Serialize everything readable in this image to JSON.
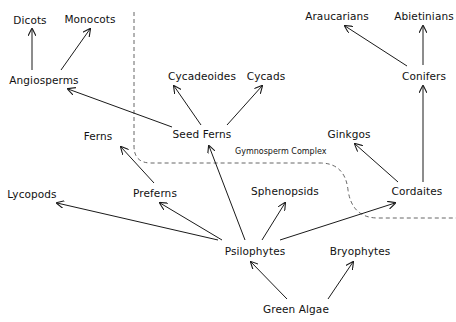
{
  "diagram": {
    "type": "phylogenetic-tree",
    "region_label": "Gymnosperm Complex",
    "nodes": [
      {
        "id": "dicots",
        "label": "Dicots",
        "x": 30,
        "y": 20
      },
      {
        "id": "monocots",
        "label": "Monocots",
        "x": 90,
        "y": 19
      },
      {
        "id": "angiosperms",
        "label": "Angiosperms",
        "x": 44,
        "y": 80
      },
      {
        "id": "cycadeoides",
        "label": "Cycadeoides",
        "x": 202,
        "y": 76
      },
      {
        "id": "cycads",
        "label": "Cycads",
        "x": 266,
        "y": 76
      },
      {
        "id": "araucarians",
        "label": "Araucarians",
        "x": 337,
        "y": 16
      },
      {
        "id": "abietinians",
        "label": "Abietinians",
        "x": 424,
        "y": 16
      },
      {
        "id": "conifers",
        "label": "Conifers",
        "x": 424,
        "y": 76
      },
      {
        "id": "seed_ferns",
        "label": "Seed Ferns",
        "x": 202,
        "y": 134
      },
      {
        "id": "ferns",
        "label": "Ferns",
        "x": 98,
        "y": 136
      },
      {
        "id": "ginkgos",
        "label": "Ginkgos",
        "x": 349,
        "y": 134
      },
      {
        "id": "lycopods",
        "label": "Lycopods",
        "x": 32,
        "y": 194
      },
      {
        "id": "preferns",
        "label": "Preferns",
        "x": 155,
        "y": 193
      },
      {
        "id": "sphenopsids",
        "label": "Sphenopsids",
        "x": 285,
        "y": 191
      },
      {
        "id": "cordaites",
        "label": "Cordaites",
        "x": 417,
        "y": 191
      },
      {
        "id": "psilophytes",
        "label": "Psilophytes",
        "x": 255,
        "y": 251
      },
      {
        "id": "bryophytes",
        "label": "Bryophytes",
        "x": 360,
        "y": 251
      },
      {
        "id": "green_algae",
        "label": "Green Algae",
        "x": 296,
        "y": 309
      }
    ],
    "edges": [
      {
        "from": "angiosperms",
        "to": "dicots",
        "x1": 32,
        "y1": 70,
        "x2": 32,
        "y2": 29
      },
      {
        "from": "angiosperms",
        "to": "monocots",
        "x1": 61,
        "y1": 70,
        "x2": 90,
        "y2": 29
      },
      {
        "from": "seed_ferns",
        "to": "angiosperms",
        "x1": 172,
        "y1": 127,
        "x2": 68,
        "y2": 89
      },
      {
        "from": "seed_ferns",
        "to": "cycadeoides",
        "x1": 201,
        "y1": 125,
        "x2": 174,
        "y2": 86
      },
      {
        "from": "seed_ferns",
        "to": "cycads",
        "x1": 227,
        "y1": 125,
        "x2": 262,
        "y2": 86
      },
      {
        "from": "conifers",
        "to": "araucarians",
        "x1": 407,
        "y1": 66,
        "x2": 345,
        "y2": 26
      },
      {
        "from": "conifers",
        "to": "abietinians",
        "x1": 423,
        "y1": 65,
        "x2": 423,
        "y2": 26
      },
      {
        "from": "cordaites",
        "to": "conifers",
        "x1": 423,
        "y1": 182,
        "x2": 423,
        "y2": 86
      },
      {
        "from": "cordaites",
        "to": "ginkgos",
        "x1": 398,
        "y1": 182,
        "x2": 355,
        "y2": 144
      },
      {
        "from": "preferns",
        "to": "ferns",
        "x1": 154,
        "y1": 183,
        "x2": 121,
        "y2": 147
      },
      {
        "from": "psilophytes",
        "to": "seed_ferns",
        "x1": 245,
        "y1": 240,
        "x2": 209,
        "y2": 146
      },
      {
        "from": "psilophytes",
        "to": "lycopods",
        "x1": 218,
        "y1": 240,
        "x2": 57,
        "y2": 203
      },
      {
        "from": "psilophytes",
        "to": "preferns",
        "x1": 222,
        "y1": 240,
        "x2": 160,
        "y2": 203
      },
      {
        "from": "psilophytes",
        "to": "sphenopsids",
        "x1": 262,
        "y1": 240,
        "x2": 285,
        "y2": 203
      },
      {
        "from": "psilophytes",
        "to": "cordaites",
        "x1": 280,
        "y1": 240,
        "x2": 395,
        "y2": 203
      },
      {
        "from": "green_algae",
        "to": "psilophytes",
        "x1": 287,
        "y1": 299,
        "x2": 251,
        "y2": 262
      },
      {
        "from": "green_algae",
        "to": "bryophytes",
        "x1": 328,
        "y1": 299,
        "x2": 353,
        "y2": 262
      }
    ],
    "colors": {
      "line": "#1a1a1a",
      "dashed_boundary": "#555555",
      "text": "#111111",
      "background": "#ffffff"
    }
  }
}
